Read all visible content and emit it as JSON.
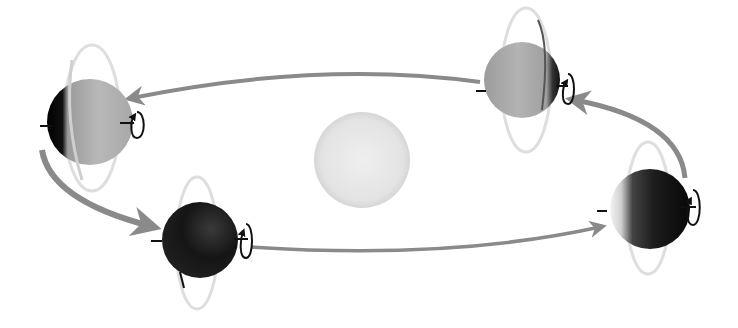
{
  "diagram": {
    "colors": {
      "background": "#ffffff",
      "sun": "#e6e6e6",
      "orbit_arrow": "#8a8a8a",
      "ring": "#dcdcdc",
      "axis": "#111111",
      "planet_light": "#b5b5b5",
      "planet_dark": "#1a1a1a"
    },
    "sun": {
      "cx": 362,
      "cy": 160,
      "r": 48
    },
    "planets": [
      {
        "id": "left",
        "cx": 90,
        "cy": 122,
        "r": 44,
        "lit_side": "right"
      },
      {
        "id": "top-right",
        "cx": 522,
        "cy": 78,
        "r": 38,
        "lit_side": "left"
      },
      {
        "id": "right",
        "cx": 650,
        "cy": 209,
        "r": 40,
        "lit_side": "left-edge"
      },
      {
        "id": "bottom",
        "cx": 200,
        "cy": 240,
        "r": 38,
        "lit_side": "none"
      }
    ],
    "orbit_arrows": [
      {
        "from": "top-right",
        "to": "left"
      },
      {
        "from": "left",
        "to": "bottom"
      },
      {
        "from": "bottom",
        "to": "right"
      },
      {
        "from": "right",
        "to": "top-right"
      }
    ]
  }
}
